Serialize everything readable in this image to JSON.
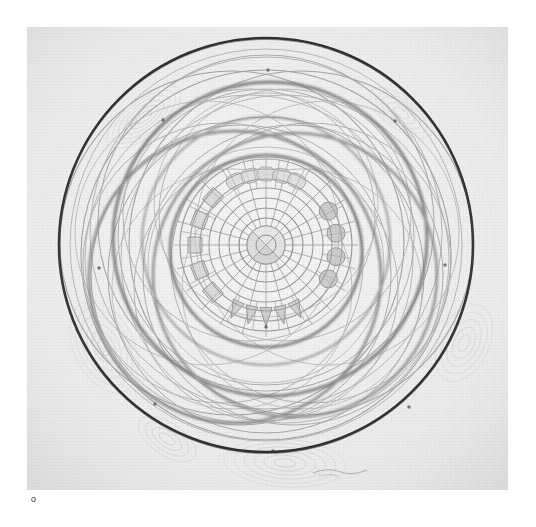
{
  "page": {
    "background_color": "#ffffff",
    "width": 536,
    "height": 527
  },
  "plate": {
    "kind": "scanned-drawing",
    "title": "Concentric circle geometric mandala drawing",
    "paper_color": "#efefee",
    "paper_edge_color": "#dcdcdb",
    "x": 27,
    "y": 27,
    "width": 481,
    "height": 463
  },
  "caption": {
    "text": "o"
  },
  "drawing": {
    "center": {
      "x": 239,
      "y": 218
    },
    "ink_dark": "#1a1a1a",
    "ink_mid": "#8a8a8a",
    "ink_light": "#b4b4b4",
    "ink_faint": "#c9c9c9",
    "outer_circle": {
      "name": "outer-boundary-circle",
      "radius": 207,
      "stroke": "#1d1d1d",
      "stroke_width": 2.6
    },
    "orbit_circles": [
      {
        "label": "orbit-1",
        "cx": 239,
        "cy": 228,
        "r": 185,
        "stroke": "#9b9b9b",
        "stroke_width": 1.1
      },
      {
        "label": "orbit-2",
        "cx": 239,
        "cy": 196,
        "r": 168,
        "stroke": "#a5a5a5",
        "stroke_width": 1.1
      },
      {
        "label": "orbit-3",
        "cx": 205,
        "cy": 216,
        "r": 172,
        "stroke": "#9e9e9e",
        "stroke_width": 1.1
      },
      {
        "label": "orbit-4",
        "cx": 274,
        "cy": 216,
        "r": 172,
        "stroke": "#9e9e9e",
        "stroke_width": 1.1
      },
      {
        "label": "orbit-5",
        "cx": 214,
        "cy": 248,
        "r": 150,
        "stroke": "#a8a8a8",
        "stroke_width": 1.0
      },
      {
        "label": "orbit-6",
        "cx": 266,
        "cy": 248,
        "r": 150,
        "stroke": "#a8a8a8",
        "stroke_width": 1.0
      },
      {
        "label": "orbit-7",
        "cx": 239,
        "cy": 248,
        "r": 158,
        "stroke": "#a0a0a0",
        "stroke_width": 1.0
      },
      {
        "label": "orbit-8",
        "cx": 239,
        "cy": 210,
        "r": 148,
        "stroke": "#ababab",
        "stroke_width": 1.0
      },
      {
        "label": "orbit-9",
        "cx": 196,
        "cy": 236,
        "r": 140,
        "stroke": "#aeaeae",
        "stroke_width": 1.0
      },
      {
        "label": "orbit-10",
        "cx": 284,
        "cy": 236,
        "r": 140,
        "stroke": "#aeaeae",
        "stroke_width": 1.0
      },
      {
        "label": "orbit-11",
        "cx": 239,
        "cy": 262,
        "r": 132,
        "stroke": "#b2b2b2",
        "stroke_width": 1.0
      },
      {
        "label": "orbit-12",
        "cx": 222,
        "cy": 188,
        "r": 126,
        "stroke": "#b2b2b2",
        "stroke_width": 1.0
      },
      {
        "label": "orbit-13",
        "cx": 258,
        "cy": 188,
        "r": 126,
        "stroke": "#b2b2b2",
        "stroke_width": 1.0
      }
    ],
    "heavy_orbits": [
      {
        "label": "heavy-orbit-upper",
        "cx": 243,
        "cy": 212,
        "r": 157,
        "stroke": "#6d6d6d",
        "stroke_width": 3.4
      },
      {
        "label": "heavy-orbit-lower-left",
        "cx": 208,
        "cy": 250,
        "r": 146,
        "stroke": "#7b7b7b",
        "stroke_width": 3.0
      },
      {
        "label": "heavy-orbit-lower-right",
        "cx": 268,
        "cy": 248,
        "r": 142,
        "stroke": "#7f7f7f",
        "stroke_width": 2.8
      },
      {
        "label": "heavy-orbit-inner",
        "cx": 239,
        "cy": 224,
        "r": 96,
        "stroke": "#707070",
        "stroke_width": 3.2
      }
    ],
    "core_rings": [
      {
        "label": "core-ring-outer-band",
        "r": 86,
        "stroke": "#999999",
        "stroke_width": 1.2
      },
      {
        "label": "core-ring-7",
        "r": 76,
        "stroke": "#9e9e9e",
        "stroke_width": 1.1
      },
      {
        "label": "core-ring-6",
        "r": 66,
        "stroke": "#9a9a9a",
        "stroke_width": 1.1
      },
      {
        "label": "core-ring-5",
        "r": 57,
        "stroke": "#9a9a9a",
        "stroke_width": 1.1
      },
      {
        "label": "core-ring-4",
        "r": 47,
        "stroke": "#979797",
        "stroke_width": 1.1
      },
      {
        "label": "core-ring-3",
        "r": 37,
        "stroke": "#959595",
        "stroke_width": 1.1
      },
      {
        "label": "core-ring-2",
        "r": 27,
        "stroke": "#8f8f8f",
        "stroke_width": 1.2
      },
      {
        "label": "core-ring-1",
        "r": 19,
        "stroke": "#888888",
        "stroke_width": 1.2
      },
      {
        "label": "core-ring-hub",
        "r": 10,
        "stroke": "#8f8f8f",
        "stroke_width": 1.0
      }
    ],
    "spokes": {
      "count": 24,
      "inner_radius": 19,
      "outer_radius": 92,
      "stroke": "#a6a6a6",
      "stroke_width": 0.9
    },
    "motifs": {
      "squares": {
        "label": "square-motifs-left",
        "count": 5,
        "fill": "#d2d2d2",
        "angle_start": 128,
        "angle_end": 232
      },
      "circles": {
        "label": "circle-motifs-right",
        "count": 4,
        "fill": "#c3c3c3",
        "angle_start": -38,
        "angle_end": 38
      },
      "triangles": {
        "label": "triangle-motifs-bottom",
        "count": 5,
        "fill": "#c8c8c8",
        "angle_start": 58,
        "angle_end": 122
      },
      "arcs_top": {
        "label": "arc-motifs-top",
        "count": 5,
        "fill": "#dadada",
        "angle_start": -122,
        "angle_end": -58
      }
    },
    "hub_quadrants": {
      "label": "hub-quadrant-shading",
      "fills": [
        "#dedede",
        "#cfcfcf",
        "#d9d9d9",
        "#e4e4e4"
      ]
    },
    "ripple_clusters": [
      {
        "label": "ripple-top-left",
        "cx": 117,
        "cy": 90,
        "rx": 34,
        "ry": 16,
        "rot": -38
      },
      {
        "label": "ripple-top-right",
        "cx": 374,
        "cy": 86,
        "rx": 32,
        "ry": 15,
        "rot": 36
      },
      {
        "label": "ripple-left",
        "cx": 77,
        "cy": 320,
        "rx": 38,
        "ry": 22,
        "rot": 64
      },
      {
        "label": "ripple-right",
        "cx": 437,
        "cy": 316,
        "rx": 38,
        "ry": 22,
        "rot": -64
      },
      {
        "label": "ripple-bottom",
        "cx": 258,
        "cy": 436,
        "rx": 48,
        "ry": 18,
        "rot": 4
      },
      {
        "label": "ripple-bottom-left",
        "cx": 140,
        "cy": 412,
        "rx": 34,
        "ry": 16,
        "rot": 34
      }
    ],
    "registration_marks": [
      {
        "label": "mark-top",
        "x": 241,
        "y": 43
      },
      {
        "label": "mark-upper-right",
        "x": 368,
        "y": 94
      },
      {
        "label": "mark-upper-left",
        "x": 136,
        "y": 93
      },
      {
        "label": "mark-left",
        "x": 72,
        "y": 241
      },
      {
        "label": "mark-right",
        "x": 418,
        "y": 238
      },
      {
        "label": "mark-lower-left",
        "x": 128,
        "y": 377
      },
      {
        "label": "mark-lower-right",
        "x": 382,
        "y": 380
      },
      {
        "label": "mark-bottom",
        "x": 246,
        "y": 424
      },
      {
        "label": "mark-center-lower",
        "x": 239,
        "y": 300
      }
    ],
    "signature": {
      "label": "pencil-signature",
      "x": 300,
      "y": 444
    }
  }
}
